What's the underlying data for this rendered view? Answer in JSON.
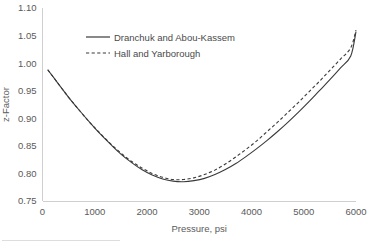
{
  "chart_data": {
    "type": "line",
    "title": "",
    "xlabel": "Pressure, psi",
    "ylabel": "z-Factor",
    "xlim": [
      0,
      6000
    ],
    "ylim": [
      0.75,
      1.1
    ],
    "xticks": [
      "0",
      "1000",
      "2000",
      "3000",
      "4000",
      "5000",
      "6000"
    ],
    "xtick_values": [
      0,
      1000,
      2000,
      3000,
      4000,
      5000,
      6000
    ],
    "yticks": [
      "0.75",
      "0.80",
      "0.85",
      "0.90",
      "0.95",
      "1.00",
      "1.05",
      "1.10"
    ],
    "ytick_values": [
      0.75,
      0.8,
      0.85,
      0.9,
      0.95,
      1.0,
      1.05,
      1.1
    ],
    "grid": false,
    "legend_position": "upper-center",
    "legend": [
      "Dranchuk and Abou-Kassem",
      "Hall and Yarborough"
    ],
    "x": [
      100,
      300,
      500,
      700,
      900,
      1100,
      1300,
      1500,
      1700,
      1900,
      2100,
      2300,
      2500,
      2700,
      2900,
      3100,
      3300,
      3500,
      3700,
      3900,
      4100,
      4300,
      4500,
      4700,
      4900,
      5100,
      5300,
      5500,
      5700,
      5900,
      6000
    ],
    "series": [
      {
        "name": "Dranchuk and Abou-Kassem",
        "style": "solid",
        "color": "#3a3a3a",
        "values": [
          0.988,
          0.963,
          0.938,
          0.915,
          0.893,
          0.872,
          0.853,
          0.835,
          0.82,
          0.807,
          0.797,
          0.79,
          0.786,
          0.785,
          0.787,
          0.791,
          0.798,
          0.807,
          0.818,
          0.831,
          0.845,
          0.86,
          0.876,
          0.893,
          0.911,
          0.93,
          0.95,
          0.97,
          0.991,
          1.013,
          1.057
        ]
      },
      {
        "name": "Hall and Yarborough",
        "style": "dashed",
        "color": "#3a3a3a",
        "values": [
          0.988,
          0.963,
          0.938,
          0.915,
          0.893,
          0.873,
          0.854,
          0.837,
          0.822,
          0.81,
          0.8,
          0.793,
          0.789,
          0.789,
          0.792,
          0.798,
          0.806,
          0.817,
          0.83,
          0.844,
          0.859,
          0.876,
          0.893,
          0.911,
          0.929,
          0.948,
          0.967,
          0.987,
          1.007,
          1.028,
          1.06
        ]
      }
    ]
  },
  "axis_titles": {
    "x": "Pressure, psi",
    "y": "z-Factor"
  }
}
